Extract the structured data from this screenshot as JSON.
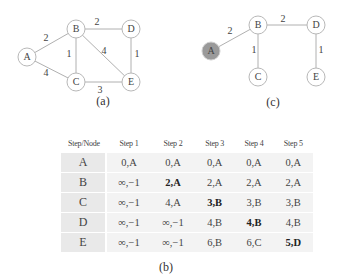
{
  "figure": {
    "graph_a": {
      "caption": "(a)",
      "nodes": [
        {
          "id": "A",
          "label": "A",
          "x": 27,
          "y": 57
        },
        {
          "id": "B",
          "label": "B",
          "x": 76,
          "y": 29
        },
        {
          "id": "C",
          "label": "C",
          "x": 76,
          "y": 82
        },
        {
          "id": "D",
          "label": "D",
          "x": 131,
          "y": 29
        },
        {
          "id": "E",
          "label": "E",
          "x": 131,
          "y": 82
        }
      ],
      "edges": [
        {
          "from": "A",
          "to": "B",
          "weight": "2",
          "label_x": 46,
          "label_y": 39
        },
        {
          "from": "A",
          "to": "C",
          "weight": "4",
          "label_x": 46,
          "label_y": 74
        },
        {
          "from": "B",
          "to": "C",
          "weight": "1",
          "label_x": 69,
          "label_y": 55
        },
        {
          "from": "B",
          "to": "D",
          "weight": "2",
          "label_x": 97,
          "label_y": 23
        },
        {
          "from": "B",
          "to": "E",
          "weight": "4",
          "label_x": 104,
          "label_y": 52
        },
        {
          "from": "D",
          "to": "E",
          "weight": "1",
          "label_x": 137,
          "label_y": 55
        },
        {
          "from": "C",
          "to": "E",
          "weight": "3",
          "label_x": 100,
          "label_y": 91
        }
      ]
    },
    "graph_c": {
      "caption": "(c)",
      "source_node": "A",
      "source_color": "#9a9a9a",
      "nodes": [
        {
          "id": "A",
          "label": "A",
          "x": 211,
          "y": 51
        },
        {
          "id": "B",
          "label": "B",
          "x": 258,
          "y": 25
        },
        {
          "id": "C",
          "label": "C",
          "x": 258,
          "y": 77
        },
        {
          "id": "D",
          "label": "D",
          "x": 316,
          "y": 25
        },
        {
          "id": "E",
          "label": "E",
          "x": 316,
          "y": 77
        }
      ],
      "edges": [
        {
          "from": "A",
          "to": "B",
          "weight": "2",
          "label_x": 230,
          "label_y": 32
        },
        {
          "from": "B",
          "to": "C",
          "weight": "1",
          "label_x": 254,
          "label_y": 51
        },
        {
          "from": "B",
          "to": "D",
          "weight": "2",
          "label_x": 283,
          "label_y": 20
        },
        {
          "from": "D",
          "to": "E",
          "weight": "1",
          "label_x": 321,
          "label_y": 51
        }
      ]
    },
    "table_b": {
      "caption": "(b)",
      "headers": [
        "Step/Node",
        "Step 1",
        "Step 2",
        "Step 3",
        "Step 4",
        "Step 5"
      ],
      "rows": [
        {
          "node": "A",
          "cells": [
            "0,A",
            "0,A",
            "0,A",
            "0,A",
            "0,A"
          ],
          "bold": []
        },
        {
          "node": "B",
          "cells": [
            "∞,−1",
            "2,A",
            "2,A",
            "2,A",
            "2,A"
          ],
          "bold": [
            1
          ]
        },
        {
          "node": "C",
          "cells": [
            "∞,−1",
            "4,A",
            "3,B",
            "3,B",
            "3,B"
          ],
          "bold": [
            2
          ]
        },
        {
          "node": "D",
          "cells": [
            "∞,−1",
            "∞,−1",
            "4,B",
            "4,B",
            "4,B"
          ],
          "bold": [
            3
          ]
        },
        {
          "node": "E",
          "cells": [
            "∞,−1",
            "∞,−1",
            "6,B",
            "6,C",
            "5,D"
          ],
          "bold": [
            4
          ]
        }
      ]
    }
  }
}
